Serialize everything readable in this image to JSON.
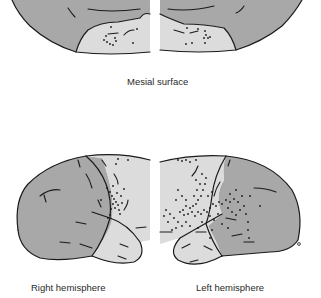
{
  "figure": {
    "panels": [
      {
        "id": "mesial",
        "label": "Mesial surface"
      },
      {
        "id": "right",
        "label": "Right hemisphere"
      },
      {
        "id": "left",
        "label": "Left hemisphere"
      }
    ]
  },
  "colors": {
    "cortex_dark": "#a8a8a8",
    "region_light": "#dcdcdc",
    "outline": "#1a1a1a",
    "background": "#ffffff"
  },
  "legend": {
    "dots": "recording / lesion sites",
    "light_region": "highlighted cortical region"
  }
}
